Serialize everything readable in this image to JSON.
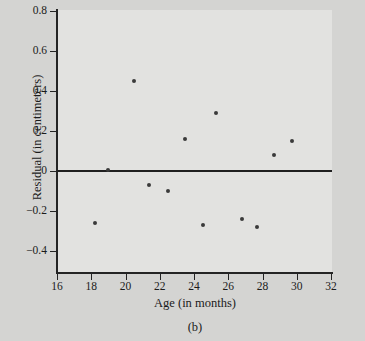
{
  "figure": {
    "caption": "(b)",
    "background_color": "#d4d4d2",
    "plot_background_color": "#e2e2e0",
    "marker_color": "#3a3a3a",
    "axis_color": "#242424"
  },
  "chart_data": {
    "type": "scatter",
    "title": "",
    "subtitle": "",
    "xlabel": "Age (in months)",
    "ylabel": "Residual (in centimeters)",
    "xlim": [
      15.0,
      32.9
    ],
    "ylim": [
      -0.53,
      0.8
    ],
    "xticks": [
      16,
      18,
      20,
      22,
      24,
      26,
      28,
      30,
      32
    ],
    "xtick_labels": [
      "16",
      "18",
      "20",
      "22",
      "24",
      "26",
      "28",
      "30",
      "32"
    ],
    "yticks": [
      0.8,
      0.6,
      0.4,
      0.2,
      0,
      -0.2,
      -0.4
    ],
    "ytick_labels": [
      "0.8",
      "0.6",
      "0.4",
      "0.2",
      "0",
      "-0.2",
      "-0.4"
    ],
    "grid": false,
    "legend": null,
    "reference_line": {
      "orientation": "horizontal",
      "y": 0,
      "label": ""
    },
    "x": [
      18.2,
      19.0,
      20.5,
      21.4,
      22.5,
      23.5,
      24.5,
      25.3,
      26.8,
      27.7,
      28.7,
      29.7
    ],
    "y": [
      -0.26,
      0.005,
      0.45,
      -0.07,
      -0.1,
      0.16,
      -0.27,
      0.29,
      -0.24,
      -0.28,
      0.08,
      0.15
    ],
    "points": [
      {
        "x": 18.2,
        "y": -0.26
      },
      {
        "x": 19.0,
        "y": 0.005
      },
      {
        "x": 20.5,
        "y": 0.45
      },
      {
        "x": 21.4,
        "y": -0.07
      },
      {
        "x": 22.5,
        "y": -0.1
      },
      {
        "x": 23.5,
        "y": 0.16
      },
      {
        "x": 24.5,
        "y": -0.27
      },
      {
        "x": 25.3,
        "y": 0.29
      },
      {
        "x": 26.8,
        "y": -0.24
      },
      {
        "x": 27.7,
        "y": -0.28
      },
      {
        "x": 28.7,
        "y": 0.08
      },
      {
        "x": 29.7,
        "y": 0.15
      }
    ]
  }
}
